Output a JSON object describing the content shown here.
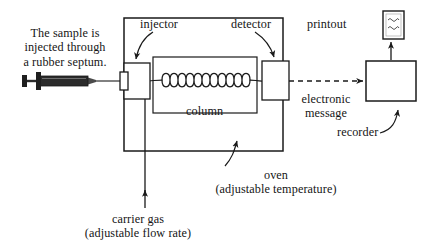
{
  "diagram": {
    "background_color": "#ffffff",
    "stroke_color": "#1a1a1a",
    "labels": {
      "sample_note": "The sample is\ninjected through\na rubber septum.",
      "injector": "injector",
      "detector": "detector",
      "printout": "printout",
      "column": "column",
      "electronic_message": "electronic\nmessage",
      "recorder": "recorder",
      "oven": "oven\n(adjustable temperature)",
      "carrier_gas": "carrier gas\n(adjustable flow rate)"
    },
    "parts": {
      "syringe": "syringe-with-needle",
      "septum_port": "injection-septum-port",
      "injector_block": "injector-block",
      "oven_enclosure": "oven-enclosure",
      "column_box": "column-box",
      "column_coil": "coiled-capillary-column",
      "coil_loops": 11,
      "detector_block": "detector-block",
      "recorder_box": "recorder-box",
      "printout_sheet": "printout-sheet",
      "carrier_gas_line": "carrier-gas-inlet-line",
      "signal_line": "dashed-electronic-signal-line"
    }
  }
}
